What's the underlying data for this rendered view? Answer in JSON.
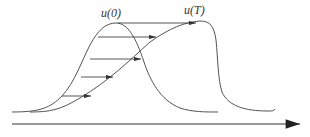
{
  "diagram": {
    "title": "",
    "labels": {
      "initial_profile": "u(0)",
      "final_profile": "u(T)"
    },
    "elements": {
      "initial_curve": "symmetric bell-shaped profile u(0)",
      "final_curve": "steepened profile u(T) with shock on right",
      "transport_arrows": 5,
      "axis": "horizontal x-axis with arrowhead at right"
    },
    "colors": {
      "stroke": "#555555",
      "arrow": "#333333",
      "background": "#ffffff"
    }
  }
}
